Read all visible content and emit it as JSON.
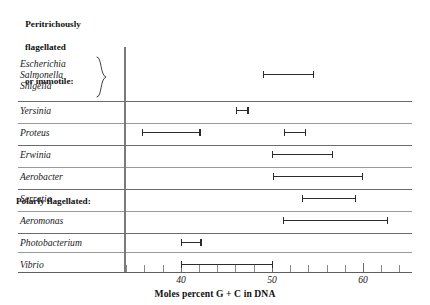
{
  "chart_data": {
    "type": "range-bar",
    "title": "",
    "xlabel": "Moles percent G + C in DNA",
    "ylabel": "",
    "xlim": [
      33,
      65
    ],
    "grid": false,
    "legend": "none",
    "axis_ticks_major": [
      40,
      50,
      60
    ],
    "axis_tick_labels": [
      "40",
      "50",
      "60"
    ],
    "axis_ticks_minor": [
      34,
      36,
      38,
      42,
      44,
      46,
      48,
      52,
      54,
      56,
      58,
      62,
      64
    ],
    "groups": [
      {
        "heading": "Peritrichously\nflagellated\nor immotile:",
        "heading_lines": [
          "Peritrichously",
          "flagellated",
          "or immotile:"
        ],
        "braced": true,
        "rows": [
          {
            "labels": [
              "Escherichia",
              "Salmonella",
              "Shigella"
            ],
            "ranges": [
              {
                "min": 49.0,
                "max": 54.5
              }
            ]
          }
        ]
      },
      {
        "heading": "",
        "heading_lines": [],
        "braced": false,
        "rows": [
          {
            "labels": [
              "Yersinia"
            ],
            "ranges": [
              {
                "min": 46.0,
                "max": 47.3
              }
            ]
          },
          {
            "labels": [
              "Proteus"
            ],
            "ranges": [
              {
                "min": 35.7,
                "max": 42.0
              },
              {
                "min": 51.3,
                "max": 53.6
              }
            ]
          },
          {
            "labels": [
              "Erwinia"
            ],
            "ranges": [
              {
                "min": 50.0,
                "max": 56.6
              }
            ]
          },
          {
            "labels": [
              "Aerobacter"
            ],
            "ranges": [
              {
                "min": 50.1,
                "max": 59.9
              }
            ]
          },
          {
            "labels": [
              "Serratia"
            ],
            "ranges": [
              {
                "min": 53.3,
                "max": 59.1
              }
            ]
          }
        ]
      },
      {
        "heading": "Polarly flagellated:",
        "heading_lines": [
          "Polarly flagellated:"
        ],
        "braced": false,
        "rows": [
          {
            "labels": [
              "Aeromonas"
            ],
            "ranges": [
              {
                "min": 51.2,
                "max": 62.6
              }
            ]
          },
          {
            "labels": [
              "Photobacterium"
            ],
            "ranges": [
              {
                "min": 40.0,
                "max": 42.1
              }
            ]
          },
          {
            "labels": [
              "Vibrio"
            ],
            "ranges": [
              {
                "min": 40.0,
                "max": 50.0
              }
            ]
          }
        ]
      }
    ]
  },
  "headings": {
    "peritrichous_line1": "Peritrichously",
    "peritrichous_line2": "flagellated",
    "peritrichous_line3": "or immotile:",
    "polar": "Polarly flagellated:"
  },
  "taxa": {
    "escherichia": "Escherichia",
    "salmonella": "Salmonella",
    "shigella": "Shigella",
    "yersinia": "Yersinia",
    "proteus": "Proteus",
    "erwinia": "Erwinia",
    "aerobacter": "Aerobacter",
    "serratia": "Serratia",
    "aeromonas": "Aeromonas",
    "photobacterium": "Photobacterium",
    "vibrio": "Vibrio"
  },
  "axis": {
    "title": "Moles percent G + C in DNA",
    "tick_40": "40",
    "tick_50": "50",
    "tick_60": "60"
  },
  "colors": {
    "bar": "#2b2b2b",
    "rule": "#9a9a9a",
    "axis": "#6a6a6a",
    "text": "#1a1a1a"
  }
}
